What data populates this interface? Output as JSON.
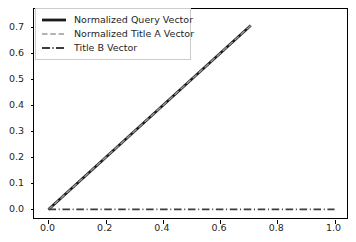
{
  "chart_data": {
    "type": "line",
    "title": "",
    "xlabel": "",
    "ylabel": "",
    "xlim": [
      -0.0505,
      1.0505
    ],
    "ylim": [
      -0.0405,
      0.7705
    ],
    "xticks": [
      0.0,
      0.2,
      0.4,
      0.6,
      0.8,
      1.0
    ],
    "xticklabels": [
      "0.0",
      "0.2",
      "0.4",
      "0.6",
      "0.8",
      "1.0"
    ],
    "yticks": [
      0.0,
      0.1,
      0.2,
      0.3,
      0.4,
      0.5,
      0.6,
      0.7
    ],
    "yticklabels": [
      "0.0",
      "0.1",
      "0.2",
      "0.3",
      "0.4",
      "0.5",
      "0.6",
      "0.7"
    ],
    "grid": false,
    "legend_position": "upper left",
    "series": [
      {
        "name": "Normalized Query Vector",
        "linestyle": "solid",
        "color": "#1a1a1a",
        "linewidth": 2.6,
        "x": [
          0.0,
          0.707
        ],
        "y": [
          0.0,
          0.707
        ]
      },
      {
        "name": "Normalized Title A Vector",
        "linestyle": "dashed",
        "color": "#9a9a9a",
        "linewidth": 1.4,
        "x": [
          0.0,
          0.707
        ],
        "y": [
          0.0,
          0.707
        ]
      },
      {
        "name": "Title B Vector",
        "linestyle": "dashdot",
        "color": "#3c3c3c",
        "linewidth": 1.8,
        "x": [
          0.0,
          1.0
        ],
        "y": [
          0.0,
          0.0
        ]
      }
    ]
  },
  "legend": {
    "items": [
      {
        "label": "Normalized Query Vector"
      },
      {
        "label": "Normalized Title A Vector"
      },
      {
        "label": "Title B Vector"
      }
    ]
  },
  "axis": {
    "x_tick_labels": [
      "0.0",
      "0.2",
      "0.4",
      "0.6",
      "0.8",
      "1.0"
    ],
    "y_tick_labels": [
      "0.0",
      "0.1",
      "0.2",
      "0.3",
      "0.4",
      "0.5",
      "0.6",
      "0.7"
    ]
  },
  "colors": {
    "series_query": "#1a1a1a",
    "series_title_a": "#9a9a9a",
    "series_title_b": "#3c3c3c",
    "axis": "#000000",
    "tick_text": "#262626",
    "legend_border": "#cccccc",
    "background": "#ffffff"
  }
}
